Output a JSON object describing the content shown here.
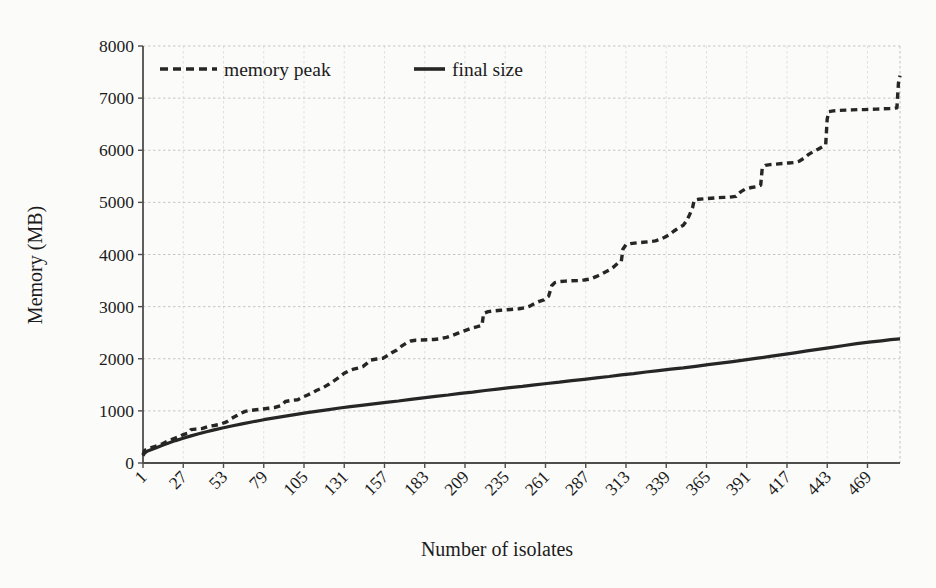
{
  "chart_data": {
    "type": "line",
    "title": "",
    "xlabel": "Number of isolates",
    "ylabel": "Memory (MB)",
    "xlim": [
      1,
      490
    ],
    "ylim": [
      0,
      8000
    ],
    "grid": true,
    "legend_position": "top-inside",
    "yticks": [
      0,
      1000,
      2000,
      3000,
      4000,
      5000,
      6000,
      7000,
      8000
    ],
    "xticks": [
      1,
      27,
      53,
      79,
      105,
      131,
      157,
      183,
      209,
      235,
      261,
      287,
      313,
      339,
      365,
      391,
      417,
      443,
      469
    ],
    "series": [
      {
        "name": "memory peak",
        "style": "dashed",
        "color": "#262626",
        "points": [
          [
            1,
            160
          ],
          [
            2,
            240
          ],
          [
            5,
            280
          ],
          [
            9,
            320
          ],
          [
            13,
            360
          ],
          [
            17,
            420
          ],
          [
            21,
            470
          ],
          [
            24,
            500
          ],
          [
            26,
            530
          ],
          [
            28,
            555
          ],
          [
            30,
            570
          ],
          [
            32,
            640
          ],
          [
            35,
            650
          ],
          [
            39,
            660
          ],
          [
            43,
            700
          ],
          [
            47,
            720
          ],
          [
            51,
            745
          ],
          [
            55,
            790
          ],
          [
            58,
            850
          ],
          [
            61,
            900
          ],
          [
            64,
            950
          ],
          [
            67,
            990
          ],
          [
            70,
            1010
          ],
          [
            74,
            1020
          ],
          [
            78,
            1035
          ],
          [
            82,
            1050
          ],
          [
            86,
            1065
          ],
          [
            90,
            1100
          ],
          [
            93,
            1180
          ],
          [
            97,
            1200
          ],
          [
            101,
            1215
          ],
          [
            104,
            1260
          ],
          [
            107,
            1300
          ],
          [
            110,
            1340
          ],
          [
            113,
            1390
          ],
          [
            117,
            1440
          ],
          [
            121,
            1510
          ],
          [
            125,
            1590
          ],
          [
            128,
            1650
          ],
          [
            131,
            1720
          ],
          [
            134,
            1770
          ],
          [
            137,
            1800
          ],
          [
            140,
            1820
          ],
          [
            143,
            1850
          ],
          [
            146,
            1920
          ],
          [
            148,
            1975
          ],
          [
            152,
            1995
          ],
          [
            156,
            2010
          ],
          [
            159,
            2060
          ],
          [
            162,
            2120
          ],
          [
            165,
            2170
          ],
          [
            168,
            2240
          ],
          [
            171,
            2300
          ],
          [
            174,
            2340
          ],
          [
            177,
            2355
          ],
          [
            181,
            2360
          ],
          [
            185,
            2365
          ],
          [
            189,
            2370
          ],
          [
            193,
            2385
          ],
          [
            197,
            2410
          ],
          [
            201,
            2450
          ],
          [
            205,
            2495
          ],
          [
            209,
            2540
          ],
          [
            213,
            2585
          ],
          [
            217,
            2615
          ],
          [
            220,
            2640
          ],
          [
            221,
            2870
          ],
          [
            224,
            2905
          ],
          [
            228,
            2920
          ],
          [
            232,
            2930
          ],
          [
            236,
            2940
          ],
          [
            240,
            2950
          ],
          [
            244,
            2960
          ],
          [
            248,
            2980
          ],
          [
            251,
            3010
          ],
          [
            254,
            3060
          ],
          [
            257,
            3100
          ],
          [
            260,
            3130
          ],
          [
            263,
            3200
          ],
          [
            265,
            3400
          ],
          [
            267,
            3460
          ],
          [
            270,
            3480
          ],
          [
            274,
            3490
          ],
          [
            278,
            3495
          ],
          [
            282,
            3500
          ],
          [
            286,
            3510
          ],
          [
            290,
            3530
          ],
          [
            294,
            3580
          ],
          [
            298,
            3640
          ],
          [
            302,
            3700
          ],
          [
            305,
            3760
          ],
          [
            308,
            3840
          ],
          [
            310,
            3870
          ],
          [
            311,
            4100
          ],
          [
            313,
            4190
          ],
          [
            316,
            4210
          ],
          [
            320,
            4225
          ],
          [
            324,
            4235
          ],
          [
            328,
            4245
          ],
          [
            332,
            4260
          ],
          [
            335,
            4290
          ],
          [
            338,
            4330
          ],
          [
            341,
            4380
          ],
          [
            344,
            4450
          ],
          [
            347,
            4510
          ],
          [
            350,
            4560
          ],
          [
            352,
            4640
          ],
          [
            354,
            4760
          ],
          [
            356,
            4900
          ],
          [
            357,
            5040
          ],
          [
            360,
            5060
          ],
          [
            364,
            5070
          ],
          [
            368,
            5080
          ],
          [
            372,
            5090
          ],
          [
            376,
            5095
          ],
          [
            380,
            5100
          ],
          [
            384,
            5115
          ],
          [
            387,
            5200
          ],
          [
            390,
            5255
          ],
          [
            394,
            5285
          ],
          [
            398,
            5305
          ],
          [
            400,
            5330
          ],
          [
            401,
            5650
          ],
          [
            403,
            5710
          ],
          [
            406,
            5725
          ],
          [
            410,
            5735
          ],
          [
            414,
            5745
          ],
          [
            418,
            5755
          ],
          [
            422,
            5765
          ],
          [
            425,
            5790
          ],
          [
            428,
            5850
          ],
          [
            431,
            5920
          ],
          [
            434,
            5975
          ],
          [
            437,
            6020
          ],
          [
            440,
            6070
          ],
          [
            442,
            6110
          ],
          [
            443,
            6600
          ],
          [
            444,
            6740
          ],
          [
            447,
            6755
          ],
          [
            451,
            6765
          ],
          [
            455,
            6770
          ],
          [
            459,
            6775
          ],
          [
            463,
            6780
          ],
          [
            467,
            6780
          ],
          [
            471,
            6785
          ],
          [
            475,
            6790
          ],
          [
            479,
            6795
          ],
          [
            483,
            6800
          ],
          [
            486,
            6805
          ],
          [
            488,
            6815
          ],
          [
            489,
            7300
          ],
          [
            490,
            7430
          ]
        ]
      },
      {
        "name": "final size",
        "style": "solid",
        "color": "#262626",
        "points": [
          [
            1,
            140
          ],
          [
            2,
            190
          ],
          [
            4,
            230
          ],
          [
            7,
            265
          ],
          [
            10,
            300
          ],
          [
            14,
            345
          ],
          [
            18,
            390
          ],
          [
            22,
            430
          ],
          [
            27,
            475
          ],
          [
            32,
            520
          ],
          [
            37,
            560
          ],
          [
            42,
            600
          ],
          [
            47,
            635
          ],
          [
            53,
            675
          ],
          [
            59,
            715
          ],
          [
            65,
            750
          ],
          [
            72,
            790
          ],
          [
            79,
            830
          ],
          [
            86,
            865
          ],
          [
            93,
            900
          ],
          [
            100,
            935
          ],
          [
            107,
            965
          ],
          [
            114,
            995
          ],
          [
            121,
            1025
          ],
          [
            128,
            1055
          ],
          [
            135,
            1080
          ],
          [
            142,
            1105
          ],
          [
            150,
            1135
          ],
          [
            158,
            1165
          ],
          [
            166,
            1190
          ],
          [
            174,
            1220
          ],
          [
            182,
            1250
          ],
          [
            190,
            1280
          ],
          [
            198,
            1305
          ],
          [
            206,
            1335
          ],
          [
            214,
            1360
          ],
          [
            222,
            1390
          ],
          [
            230,
            1415
          ],
          [
            238,
            1445
          ],
          [
            246,
            1470
          ],
          [
            254,
            1500
          ],
          [
            262,
            1525
          ],
          [
            270,
            1550
          ],
          [
            278,
            1580
          ],
          [
            286,
            1605
          ],
          [
            294,
            1635
          ],
          [
            302,
            1660
          ],
          [
            310,
            1690
          ],
          [
            318,
            1715
          ],
          [
            326,
            1745
          ],
          [
            334,
            1770
          ],
          [
            342,
            1800
          ],
          [
            350,
            1825
          ],
          [
            358,
            1855
          ],
          [
            366,
            1885
          ],
          [
            374,
            1915
          ],
          [
            382,
            1945
          ],
          [
            390,
            1980
          ],
          [
            398,
            2010
          ],
          [
            406,
            2045
          ],
          [
            414,
            2080
          ],
          [
            422,
            2115
          ],
          [
            430,
            2150
          ],
          [
            438,
            2185
          ],
          [
            446,
            2220
          ],
          [
            454,
            2255
          ],
          [
            462,
            2290
          ],
          [
            470,
            2320
          ],
          [
            478,
            2345
          ],
          [
            484,
            2365
          ],
          [
            490,
            2380
          ]
        ]
      }
    ]
  },
  "legend": {
    "items": [
      {
        "label": "memory peak",
        "style": "dashed"
      },
      {
        "label": "final size",
        "style": "solid"
      }
    ]
  }
}
